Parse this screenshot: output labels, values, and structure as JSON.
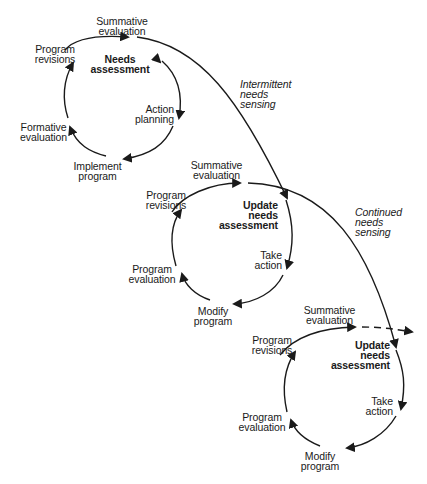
{
  "diagram": {
    "type": "spiral-cycle-diagram",
    "stroke_color": "#1a1a1a",
    "cycles": [
      {
        "id": "cycle-1",
        "center_label": "Needs\nassessment",
        "steps": [
          "Action\nplanning",
          "Implement\nprogram",
          "Formative\nevaluation",
          "Program\nrevisions",
          "Summative\nevaluation"
        ]
      },
      {
        "id": "cycle-2",
        "center_label": "Update\nneeds\nassessment",
        "steps": [
          "Take\naction",
          "Modify\nprogram",
          "Program\nevaluation",
          "Program\nrevisions",
          "Summative\nevaluation"
        ]
      },
      {
        "id": "cycle-3",
        "center_label": "Update\nneeds\nassessment",
        "steps": [
          "Take\naction",
          "Modify\nprogram",
          "Program\nevaluation",
          "Program\nrevisions",
          "Summative\nevaluation"
        ]
      }
    ],
    "connectors": [
      {
        "from": "cycle-1",
        "to": "cycle-2",
        "label": "Intermittent\nneeds\nsensing",
        "style": "solid"
      },
      {
        "from": "cycle-2",
        "to": "cycle-3",
        "label": "Continued\nneeds\nsensing",
        "style": "solid"
      },
      {
        "from": "cycle-3",
        "to": "beyond",
        "label": "",
        "style": "dashed"
      }
    ]
  }
}
